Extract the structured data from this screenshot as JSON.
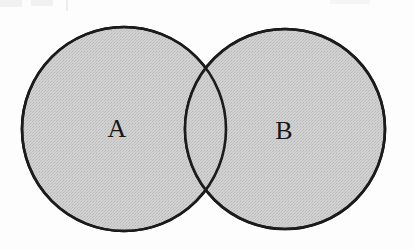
{
  "figure": {
    "kind": "venn-diagram",
    "title": "",
    "width": 414,
    "height": 250,
    "background_color": "#fdfdfd"
  },
  "style": {
    "fill_color": "#c8c8c8",
    "fill_texture": "halftone-dither",
    "stroke_color": "#1a1a1a",
    "stroke_width": 2.6,
    "label_color": "#171717",
    "label_font_size": 26
  },
  "sets": [
    {
      "label": "A",
      "cx": 124,
      "cy": 129,
      "r": 102,
      "label_x": 117,
      "label_y": 137,
      "fill": "#c8c8c8",
      "stroke": "#1a1a1a"
    },
    {
      "label": "B",
      "cx": 285,
      "cy": 129,
      "r": 100,
      "label_x": 284,
      "label_y": 139,
      "fill": "#c8c8c8",
      "stroke": "#1a1a1a"
    }
  ],
  "intersection": {
    "label": "",
    "shaded": true,
    "fill": "#c8c8c8",
    "upper_crossing_x": 205,
    "upper_crossing_y": 72,
    "lower_crossing_x": 205,
    "lower_crossing_y": 190
  }
}
